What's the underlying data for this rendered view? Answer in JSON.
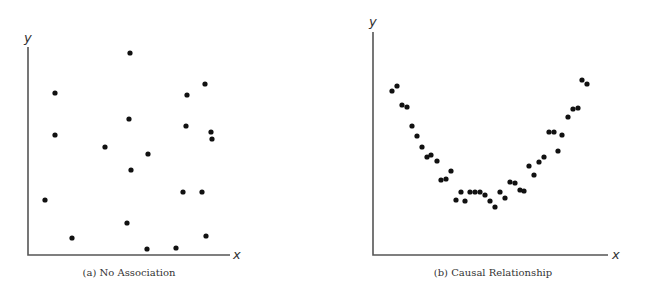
{
  "chart_data": [
    {
      "type": "scatter",
      "title": "No Association",
      "caption": "(a) No Association",
      "xlabel": "x",
      "ylabel": "y",
      "grid": false,
      "legend": null,
      "xlim": [
        0,
        100
      ],
      "ylim": [
        0,
        100
      ],
      "points": [
        {
          "x": 51,
          "y": 97
        },
        {
          "x": 13,
          "y": 78
        },
        {
          "x": 88,
          "y": 82
        },
        {
          "x": 79,
          "y": 77
        },
        {
          "x": 50,
          "y": 66
        },
        {
          "x": 78,
          "y": 62
        },
        {
          "x": 13,
          "y": 58
        },
        {
          "x": 91,
          "y": 59
        },
        {
          "x": 91,
          "y": 56
        },
        {
          "x": 38,
          "y": 52
        },
        {
          "x": 60,
          "y": 49
        },
        {
          "x": 51,
          "y": 41
        },
        {
          "x": 77,
          "y": 30
        },
        {
          "x": 86,
          "y": 30
        },
        {
          "x": 8,
          "y": 26
        },
        {
          "x": 49,
          "y": 15
        },
        {
          "x": 22,
          "y": 8
        },
        {
          "x": 88,
          "y": 9
        },
        {
          "x": 59,
          "y": 3
        },
        {
          "x": 73,
          "y": 3
        }
      ]
    },
    {
      "type": "scatter",
      "title": "Causal Relationship",
      "caption": "(b) Causal Relationship",
      "xlabel": "x",
      "ylabel": "y",
      "grid": false,
      "legend": null,
      "xlim": [
        0,
        100
      ],
      "ylim": [
        0,
        100
      ],
      "points": [
        {
          "x": 8,
          "y": 73
        },
        {
          "x": 10,
          "y": 76
        },
        {
          "x": 12,
          "y": 67
        },
        {
          "x": 14,
          "y": 66
        },
        {
          "x": 17,
          "y": 58
        },
        {
          "x": 19,
          "y": 53
        },
        {
          "x": 21,
          "y": 49
        },
        {
          "x": 23,
          "y": 44
        },
        {
          "x": 25,
          "y": 45
        },
        {
          "x": 27,
          "y": 42
        },
        {
          "x": 29,
          "y": 33
        },
        {
          "x": 31,
          "y": 34
        },
        {
          "x": 33,
          "y": 38
        },
        {
          "x": 35,
          "y": 25
        },
        {
          "x": 37,
          "y": 28
        },
        {
          "x": 39,
          "y": 24
        },
        {
          "x": 41,
          "y": 28
        },
        {
          "x": 43,
          "y": 28
        },
        {
          "x": 45,
          "y": 28
        },
        {
          "x": 47,
          "y": 27
        },
        {
          "x": 49,
          "y": 24
        },
        {
          "x": 52,
          "y": 22
        },
        {
          "x": 54,
          "y": 28
        },
        {
          "x": 56,
          "y": 25
        },
        {
          "x": 58,
          "y": 33
        },
        {
          "x": 60,
          "y": 32
        },
        {
          "x": 62,
          "y": 29
        },
        {
          "x": 64,
          "y": 29
        },
        {
          "x": 66,
          "y": 40
        },
        {
          "x": 68,
          "y": 36
        },
        {
          "x": 70,
          "y": 42
        },
        {
          "x": 72,
          "y": 44
        },
        {
          "x": 74,
          "y": 55
        },
        {
          "x": 77,
          "y": 55
        },
        {
          "x": 78,
          "y": 47
        },
        {
          "x": 80,
          "y": 54
        },
        {
          "x": 83,
          "y": 62
        },
        {
          "x": 85,
          "y": 65
        },
        {
          "x": 87,
          "y": 66
        },
        {
          "x": 89,
          "y": 78
        },
        {
          "x": 91,
          "y": 77
        }
      ]
    }
  ],
  "panels": {
    "a": {
      "caption": "(a) No Association",
      "xlabel": "x",
      "ylabel": "y",
      "pixel_points": [
        [
          130,
          53
        ],
        [
          55,
          93
        ],
        [
          205,
          84
        ],
        [
          187,
          95
        ],
        [
          129,
          119
        ],
        [
          186,
          126
        ],
        [
          55,
          135
        ],
        [
          211,
          132
        ],
        [
          212,
          139
        ],
        [
          105,
          147
        ],
        [
          148,
          154
        ],
        [
          131,
          170
        ],
        [
          183,
          192
        ],
        [
          202,
          192
        ],
        [
          45,
          200
        ],
        [
          127,
          223
        ],
        [
          72,
          238
        ],
        [
          206,
          236
        ],
        [
          147,
          249
        ],
        [
          176,
          248
        ]
      ]
    },
    "b": {
      "caption": "(b) Causal Relationship",
      "xlabel": "x",
      "ylabel": "y",
      "pixel_points": [
        [
          392,
          91
        ],
        [
          397,
          86
        ],
        [
          402,
          105
        ],
        [
          407,
          107
        ],
        [
          412,
          126
        ],
        [
          417,
          136
        ],
        [
          422,
          147
        ],
        [
          427,
          157
        ],
        [
          431,
          155
        ],
        [
          437,
          161
        ],
        [
          441,
          180
        ],
        [
          446,
          179
        ],
        [
          451,
          171
        ],
        [
          456,
          200
        ],
        [
          461,
          192
        ],
        [
          465,
          201
        ],
        [
          470,
          192
        ],
        [
          475,
          192
        ],
        [
          480,
          192
        ],
        [
          485,
          195
        ],
        [
          490,
          201
        ],
        [
          495,
          207
        ],
        [
          500,
          192
        ],
        [
          505,
          198
        ],
        [
          510,
          182
        ],
        [
          515,
          183
        ],
        [
          520,
          190
        ],
        [
          524,
          191
        ],
        [
          529,
          166
        ],
        [
          534,
          175
        ],
        [
          539,
          162
        ],
        [
          544,
          157
        ],
        [
          549,
          132
        ],
        [
          554,
          132
        ],
        [
          558,
          151
        ],
        [
          562,
          135
        ],
        [
          568,
          117
        ],
        [
          573,
          109
        ],
        [
          578,
          108
        ],
        [
          582,
          80
        ],
        [
          587,
          84
        ]
      ]
    }
  }
}
